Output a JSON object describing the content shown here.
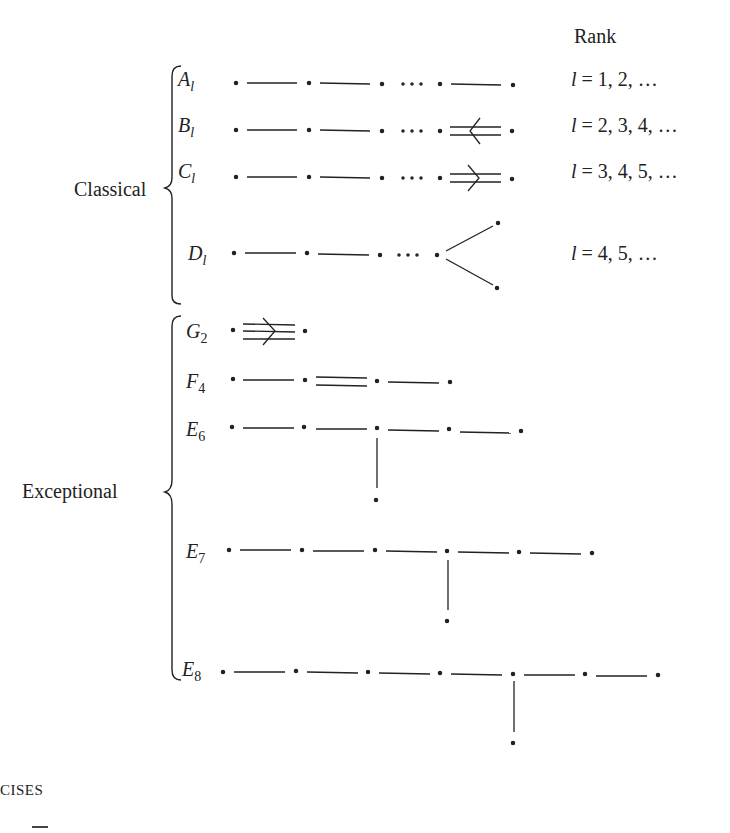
{
  "header": {
    "rank_title": "Rank"
  },
  "groups": {
    "classical": {
      "label": "Classical"
    },
    "exceptional": {
      "label": "Exceptional"
    }
  },
  "classical": [
    {
      "letter": "A",
      "sub": "l",
      "rank": "l = 1, 2, …",
      "rank_var": "l",
      "rank_values": "= 1, 2, …"
    },
    {
      "letter": "B",
      "sub": "l",
      "rank": "l = 2, 3, 4, …",
      "rank_var": "l",
      "rank_values": "= 2, 3, 4, …"
    },
    {
      "letter": "C",
      "sub": "l",
      "rank": "l = 3, 4, 5, …",
      "rank_var": "l",
      "rank_values": "= 3, 4, 5, …"
    },
    {
      "letter": "D",
      "sub": "l",
      "rank": "l = 4, 5, …",
      "rank_var": "l",
      "rank_values": "= 4, 5, …"
    }
  ],
  "exceptional": [
    {
      "letter": "G",
      "sub": "2"
    },
    {
      "letter": "F",
      "sub": "4"
    },
    {
      "letter": "E",
      "sub": "6"
    },
    {
      "letter": "E",
      "sub": "7"
    },
    {
      "letter": "E",
      "sub": "8"
    }
  ],
  "footer": {
    "section_fragment": "CISES"
  },
  "ellipsis": "· · ·"
}
